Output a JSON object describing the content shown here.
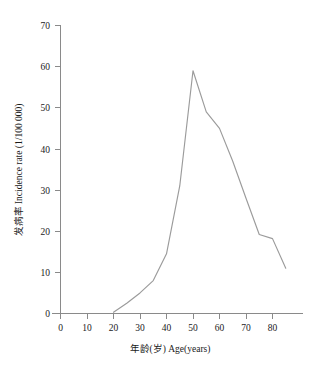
{
  "chart_data": {
    "type": "line",
    "title": "",
    "xlabel": "年龄(岁) Age(years)",
    "ylabel": "发病率 Incidence  rate (1/100 000)",
    "xlim": [
      0,
      87
    ],
    "ylim": [
      0,
      70
    ],
    "xticks": [
      0,
      10,
      20,
      30,
      40,
      50,
      60,
      70,
      80
    ],
    "yticks": [
      0,
      10,
      20,
      30,
      40,
      50,
      60,
      70
    ],
    "xtick_labels": [
      "0",
      "10",
      "20",
      "30",
      "40",
      "50",
      "60",
      "70",
      "80"
    ],
    "ytick_labels": [
      "0",
      "10",
      "20",
      "30",
      "40",
      "50",
      "60",
      "70"
    ],
    "grid": false,
    "legend": "none",
    "series": [
      {
        "name": "Incidence rate",
        "color": "#9b9b9b",
        "x": [
          20,
          25,
          30,
          35,
          40,
          45,
          50,
          55,
          60,
          65,
          70,
          75,
          80,
          85
        ],
        "values": [
          0.3,
          2.5,
          5.0,
          8.0,
          14.5,
          31.0,
          59.0,
          49.0,
          45.0,
          37.0,
          28.0,
          19.2,
          18.2,
          11.0
        ]
      }
    ]
  },
  "caption": {
    "text": ""
  }
}
